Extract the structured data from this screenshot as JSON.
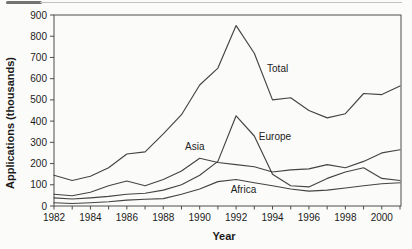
{
  "figure": {
    "kind": "scanned line chart figure",
    "background": "#fbfbfa",
    "line_color": "#3a3a3a",
    "text_color": "#1b1b1b"
  },
  "chart_data": {
    "type": "line",
    "title": "",
    "xlabel": "Year",
    "ylabel": "Applications (thousands)",
    "x": [
      1982,
      1983,
      1984,
      1985,
      1986,
      1987,
      1988,
      1989,
      1990,
      1991,
      1992,
      1993,
      1994,
      1995,
      1996,
      1997,
      1998,
      1999,
      2000,
      2001
    ],
    "xlim": [
      1982,
      2001
    ],
    "ylim": [
      0,
      900
    ],
    "yticks": [
      0,
      100,
      200,
      300,
      400,
      500,
      600,
      700,
      800,
      900
    ],
    "xticks_labeled": [
      1982,
      1984,
      1986,
      1988,
      1990,
      1992,
      1994,
      1996,
      1998,
      2000
    ],
    "grid": false,
    "legend": "none - series labeled inline on plot",
    "series": [
      {
        "name": "Total",
        "label": "Total",
        "values": [
          145,
          120,
          140,
          180,
          245,
          255,
          340,
          430,
          570,
          650,
          850,
          720,
          500,
          510,
          450,
          415,
          435,
          530,
          525,
          565
        ],
        "label_pos": {
          "year": 1993.7,
          "value": 630
        }
      },
      {
        "name": "Europe",
        "label": "Europe",
        "values": [
          38,
          33,
          38,
          45,
          55,
          60,
          75,
          100,
          145,
          210,
          425,
          330,
          150,
          95,
          90,
          130,
          160,
          180,
          130,
          120
        ],
        "label_pos": {
          "year": 1993.25,
          "value": 310
        }
      },
      {
        "name": "Asia",
        "label": "Asia",
        "values": [
          55,
          48,
          65,
          95,
          118,
          95,
          125,
          165,
          225,
          205,
          195,
          185,
          160,
          170,
          175,
          195,
          180,
          210,
          250,
          265
        ],
        "label_pos": {
          "year": 1989.2,
          "value": 262
        }
      },
      {
        "name": "Africa",
        "label": "Africa",
        "values": [
          15,
          12,
          15,
          20,
          28,
          32,
          35,
          55,
          80,
          115,
          125,
          110,
          95,
          80,
          70,
          75,
          85,
          95,
          105,
          110
        ],
        "label_pos": {
          "year": 1991.7,
          "value": 60
        }
      }
    ]
  }
}
